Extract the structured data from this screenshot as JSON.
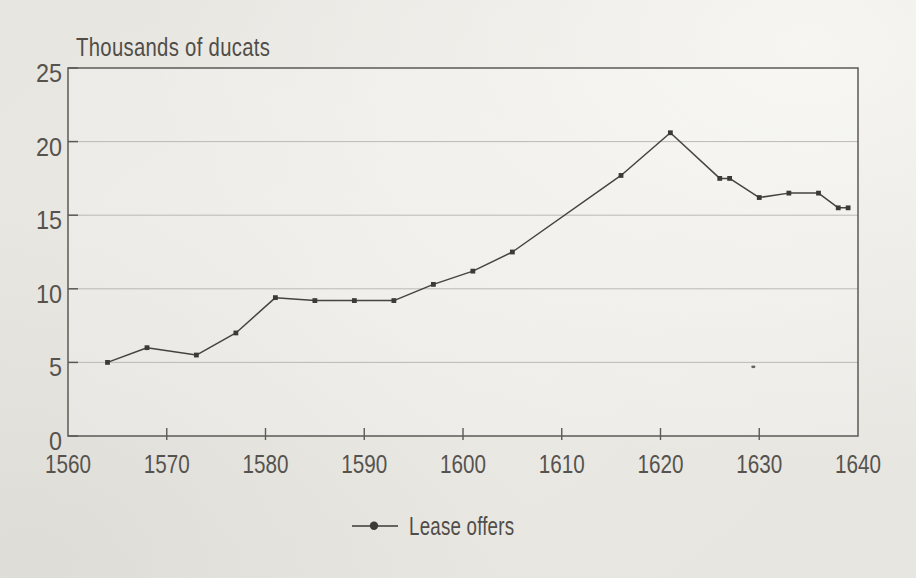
{
  "figure": {
    "title": "Thousands of ducats",
    "kind": "scanned book chart"
  },
  "chart_data": {
    "type": "line",
    "title": "Thousands of ducats",
    "xlabel": "",
    "ylabel": "Thousands of ducats",
    "xlim": [
      1560,
      1640
    ],
    "ylim": [
      0,
      25
    ],
    "x_ticks": [
      1560,
      1570,
      1580,
      1590,
      1600,
      1610,
      1620,
      1630,
      1640
    ],
    "y_ticks": [
      0,
      5,
      10,
      15,
      20,
      25
    ],
    "grid": "horizontal-only",
    "legend_position": "bottom-center",
    "series": [
      {
        "name": "Lease offers",
        "marker": "small-square-dot",
        "color": "#3c3a36",
        "x": [
          1564,
          1568,
          1573,
          1577,
          1581,
          1585,
          1589,
          1593,
          1597,
          1601,
          1605,
          1616,
          1621,
          1626,
          1627,
          1630,
          1633,
          1636,
          1638,
          1639
        ],
        "values": [
          5.0,
          6.0,
          5.5,
          7.0,
          9.4,
          9.2,
          9.2,
          9.2,
          10.3,
          11.2,
          12.5,
          17.7,
          20.6,
          17.5,
          17.5,
          16.2,
          16.5,
          16.5,
          15.5,
          15.5
        ]
      }
    ],
    "artifacts": [
      {
        "note": "tiny scan speck lying on the 5 gridline",
        "x": 1629.4,
        "y": 4.7
      }
    ]
  },
  "legend": {
    "label": "Lease offers"
  },
  "colors": {
    "background": "#e8e6e1",
    "axis": "#5d5a55",
    "grid": "#b6b4af",
    "series": "#3c3a36",
    "text": "#56534e"
  }
}
